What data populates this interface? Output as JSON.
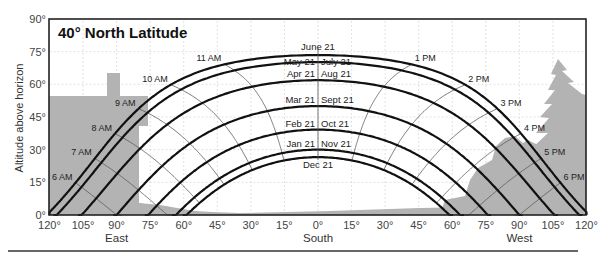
{
  "chart_data": {
    "type": "line",
    "title": "40° North Latitude",
    "xlabel": "Azimuth (East — South — West)",
    "ylabel": "Altitude above horizon",
    "latitude": 40,
    "x_range": [
      -120,
      120
    ],
    "y_range": [
      0,
      90
    ],
    "x_ticks": [
      "120°",
      "105°",
      "90°",
      "75°",
      "60°",
      "45°",
      "30°",
      "15°",
      "0°",
      "15°",
      "30°",
      "45°",
      "60°",
      "75°",
      "90°",
      "105°",
      "120°"
    ],
    "y_ticks": [
      "0°",
      "15°",
      "30°",
      "45°",
      "60°",
      "75°",
      "90°"
    ],
    "direction_labels": [
      {
        "label": "East",
        "azimuth": -90
      },
      {
        "label": "South",
        "azimuth": 0
      },
      {
        "label": "West",
        "azimuth": 90
      }
    ],
    "grid": true,
    "series": [
      {
        "name": "June 21",
        "declination": 23.44,
        "label_left": "June 21",
        "label_right": ""
      },
      {
        "name": "May 21 / July 21",
        "declination": 20.2,
        "label_left": "May 21",
        "label_right": "July 21"
      },
      {
        "name": "Apr 21 / Aug 21",
        "declination": 11.9,
        "label_left": "Apr 21",
        "label_right": "Aug 21"
      },
      {
        "name": "Mar 21 / Sept 21",
        "declination": 0,
        "label_left": "Mar 21",
        "label_right": "Sept 21"
      },
      {
        "name": "Feb 21 / Oct 21",
        "declination": -10.8,
        "label_left": "Feb 21",
        "label_right": "Oct 21"
      },
      {
        "name": "Jan 21 / Nov 21",
        "declination": -20.0,
        "label_left": "Jan 21",
        "label_right": "Nov 21"
      },
      {
        "name": "Dec 21",
        "declination": -23.44,
        "label_left": "Dec 21",
        "label_right": ""
      }
    ],
    "noon_altitudes": [
      73.4,
      70.2,
      61.9,
      50.0,
      39.2,
      30.0,
      26.6
    ],
    "hour_lines": [
      "6 AM",
      "7 AM",
      "8 AM",
      "9 AM",
      "10 AM",
      "11 AM",
      "1 PM",
      "2 PM",
      "3 PM",
      "4 PM",
      "5 PM",
      "6 PM"
    ],
    "hour_values": [
      6,
      7,
      8,
      9,
      10,
      11,
      13,
      14,
      15,
      16,
      17,
      18
    ],
    "obstructions": [
      {
        "name": "house",
        "side": "east"
      },
      {
        "name": "tree",
        "side": "west"
      },
      {
        "name": "bushes",
        "side": "west"
      },
      {
        "name": "ground",
        "side": "south"
      }
    ],
    "colors": {
      "path_line": "#111111",
      "hour_line": "#555555",
      "grid": "#cfcfcf",
      "obstruction": "#b3b3b3",
      "frame": "#222222"
    }
  }
}
